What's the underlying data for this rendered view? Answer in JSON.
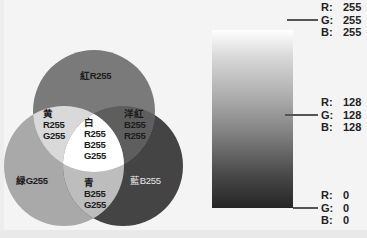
{
  "venn": {
    "circles": [
      {
        "name": "red",
        "cx": 94,
        "cy": 111,
        "r": 61,
        "fill": "#7a7a7a"
      },
      {
        "name": "green",
        "cx": 64,
        "cy": 166,
        "r": 60,
        "fill": "#a9a9a9"
      },
      {
        "name": "blue",
        "cx": 123,
        "cy": 166,
        "r": 60,
        "fill": "#444444"
      }
    ],
    "regions": {
      "yellow_fill": "#d9d9d9",
      "magenta_fill": "#5e5e5e",
      "cyan_fill": "#bdbdbd",
      "white_fill": "#ffffff"
    },
    "labels": {
      "red": "紅R255",
      "yellow": "黄\nR255\nG255",
      "magenta": "洋紅\nB255\nR255",
      "white": "白\nR255\nB255\nG255",
      "green": "緑G255",
      "cyan": "青\nB255\nG255",
      "blue": "藍B255"
    }
  },
  "gradient": {
    "top_color": "#ffffff",
    "bottom_color": "#262626",
    "markers": [
      {
        "position": "top",
        "R": "255",
        "G": "255",
        "B": "255"
      },
      {
        "position": "middle",
        "R": "128",
        "G": "128",
        "B": "128"
      },
      {
        "position": "bottom",
        "R": "0",
        "G": "0",
        "B": "0"
      }
    ],
    "keys": {
      "r": "R:",
      "g": "G:",
      "b": "B:"
    }
  }
}
